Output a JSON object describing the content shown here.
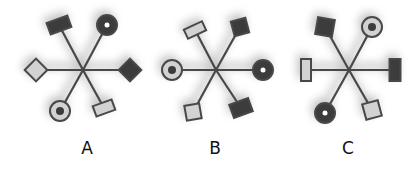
{
  "colors": {
    "dark": "#3c3c3c",
    "light": "#d2d2d2",
    "stroke": "#484848",
    "shadow": "#9a9a9a"
  },
  "figures": [
    {
      "label": "A",
      "center": [
        83,
        70
      ],
      "label_x": 72,
      "arms": [
        {
          "dir": "top-left",
          "end": [
            59,
            25
          ],
          "shape": "rect",
          "fill": "dark",
          "angle": -20,
          "w": 22,
          "h": 12
        },
        {
          "dir": "top-right",
          "end": [
            107,
            25
          ],
          "shape": "circle",
          "fill": "dark",
          "inner": "white-dot"
        },
        {
          "dir": "left",
          "end": [
            36,
            70
          ],
          "shape": "diamond",
          "fill": "light"
        },
        {
          "dir": "right",
          "end": [
            130,
            70
          ],
          "shape": "diamond",
          "fill": "dark"
        },
        {
          "dir": "bottom-left",
          "end": [
            60,
            111
          ],
          "shape": "circle",
          "fill": "light",
          "inner": "dark-dot"
        },
        {
          "dir": "bottom-right",
          "end": [
            104,
            108
          ],
          "shape": "rect",
          "fill": "light",
          "angle": -20,
          "w": 20,
          "h": 11
        }
      ]
    },
    {
      "label": "B",
      "center": [
        216,
        70
      ],
      "label_x": 200,
      "arms": [
        {
          "dir": "top-left",
          "end": [
            195,
            30
          ],
          "shape": "rect",
          "fill": "light",
          "angle": -25,
          "w": 20,
          "h": 10
        },
        {
          "dir": "top-right",
          "end": [
            240,
            27
          ],
          "shape": "square",
          "fill": "dark",
          "angle": -15,
          "w": 15,
          "h": 15
        },
        {
          "dir": "left",
          "end": [
            172,
            70
          ],
          "shape": "circle",
          "fill": "light",
          "inner": "dark-dot"
        },
        {
          "dir": "right",
          "end": [
            263,
            70
          ],
          "shape": "circle",
          "fill": "dark",
          "inner": "white-dot"
        },
        {
          "dir": "bottom-left",
          "end": [
            193,
            112
          ],
          "shape": "square",
          "fill": "light",
          "angle": -10,
          "w": 15,
          "h": 15
        },
        {
          "dir": "bottom-right",
          "end": [
            241,
            108
          ],
          "shape": "rect",
          "fill": "dark",
          "angle": -20,
          "w": 20,
          "h": 14
        }
      ]
    },
    {
      "label": "C",
      "center": [
        349,
        70
      ],
      "label_x": 333,
      "arms": [
        {
          "dir": "top-left",
          "end": [
            325,
            27
          ],
          "shape": "square",
          "fill": "dark",
          "angle": 10,
          "w": 17,
          "h": 17
        },
        {
          "dir": "top-right",
          "end": [
            372,
            27
          ],
          "shape": "circle",
          "fill": "light",
          "inner": "dark-dot"
        },
        {
          "dir": "left",
          "end": [
            306,
            70
          ],
          "shape": "rect",
          "fill": "light",
          "angle": 0,
          "w": 10,
          "h": 22
        },
        {
          "dir": "right",
          "end": [
            395,
            70
          ],
          "shape": "rect",
          "fill": "dark",
          "angle": 0,
          "w": 11,
          "h": 22
        },
        {
          "dir": "bottom-left",
          "end": [
            325,
            113
          ],
          "shape": "circle",
          "fill": "dark",
          "inner": "white-dot"
        },
        {
          "dir": "bottom-right",
          "end": [
            372,
            110
          ],
          "shape": "square",
          "fill": "light",
          "angle": -15,
          "w": 16,
          "h": 16
        }
      ]
    }
  ]
}
